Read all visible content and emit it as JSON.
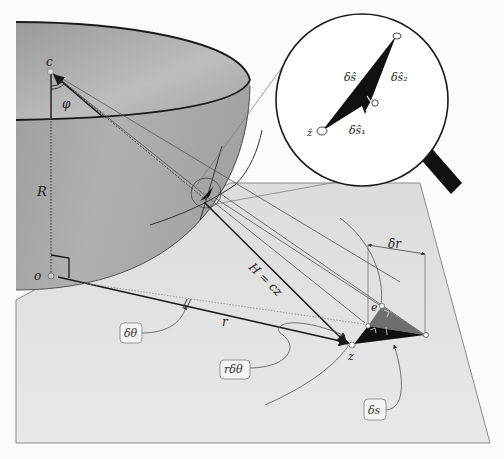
{
  "diagram": {
    "type": "geometric-construction",
    "colors": {
      "background": "#fbfbfb",
      "bowl_fill": "#a9a9a9",
      "bowl_inner": "#b8b8b8",
      "plane_fill": "#e2e2e2",
      "plane_edge": "#8a8a8a",
      "ink": "#1a1a1a",
      "triangle_dark": "#111111",
      "triangle_grey": "#6e6e6e",
      "label_box_border": "#8a8a8a",
      "label_box_fill": "#f4f4f4"
    }
  },
  "labels": {
    "c": "c",
    "phi": "φ",
    "R": "R",
    "o": "o",
    "r": "r",
    "H": "H = cz",
    "z": "z",
    "e": "e",
    "delta_r": "δr",
    "delta_theta_box": "δθ",
    "r_delta_theta_box": "rδθ",
    "delta_s_box": "δs",
    "tick_mark": "//"
  },
  "magnifier": {
    "labels": {
      "delta_s_hat": "δŝ",
      "delta_s2_hat": "δŝ₂",
      "delta_s1_hat": "δŝ₁",
      "z_hat": "ẑ"
    }
  }
}
